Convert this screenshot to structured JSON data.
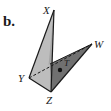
{
  "figure": {
    "part_label": "b.",
    "vertices": {
      "X": "X",
      "Y": "Y",
      "Z": "Z",
      "W": "W",
      "T": "T"
    },
    "faces": [
      {
        "name": "XYZ",
        "color": "#b9b9b9"
      },
      {
        "name": "XZ-side",
        "color": "#9a9a9a"
      },
      {
        "name": "YZW",
        "color": "#6e6e6e"
      }
    ],
    "hidden_edge": "YW",
    "point": "T",
    "colors": {
      "edge": "#1a1a1a",
      "point": "#111111"
    }
  }
}
